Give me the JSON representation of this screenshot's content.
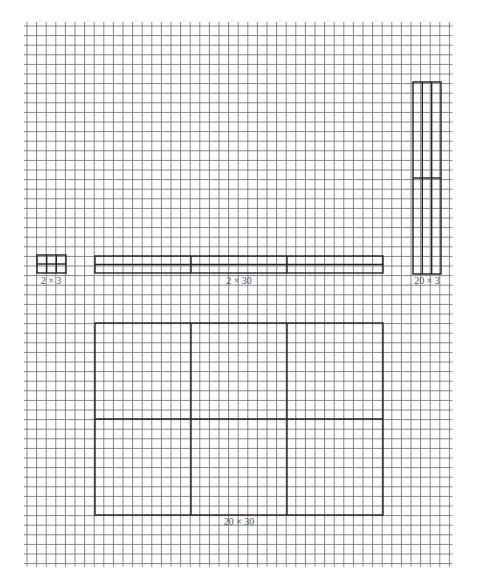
{
  "grid": {
    "x0": 27,
    "y0": 26,
    "cell": 9.6,
    "cols": 44,
    "rows": 56,
    "line_color": "#777777",
    "line_width": 0.9
  },
  "rectangles": [
    {
      "id": "2x3",
      "label": "2 × 3",
      "x": 37,
      "y": 255,
      "w": 29,
      "h": 18,
      "cols_div": 3,
      "rows_div": 2,
      "label_x": 51,
      "label_y": 276
    },
    {
      "id": "2x30",
      "label": "2 × 30",
      "x": 95,
      "y": 256,
      "w": 288,
      "h": 17,
      "cols_div": 3,
      "rows_div": 2,
      "label_x": 239,
      "label_y": 276
    },
    {
      "id": "20x3",
      "label": "20 × 3",
      "x": 413,
      "y": 82,
      "w": 28,
      "h": 192,
      "cols_div": 3,
      "rows_div": 2,
      "label_x": 427,
      "label_y": 276
    },
    {
      "id": "20x30",
      "label": "20 × 30",
      "x": 95,
      "y": 323,
      "w": 288,
      "h": 192,
      "cols_div": 3,
      "rows_div": 2,
      "label_x": 239,
      "label_y": 517
    }
  ],
  "rect_color": "#222222"
}
